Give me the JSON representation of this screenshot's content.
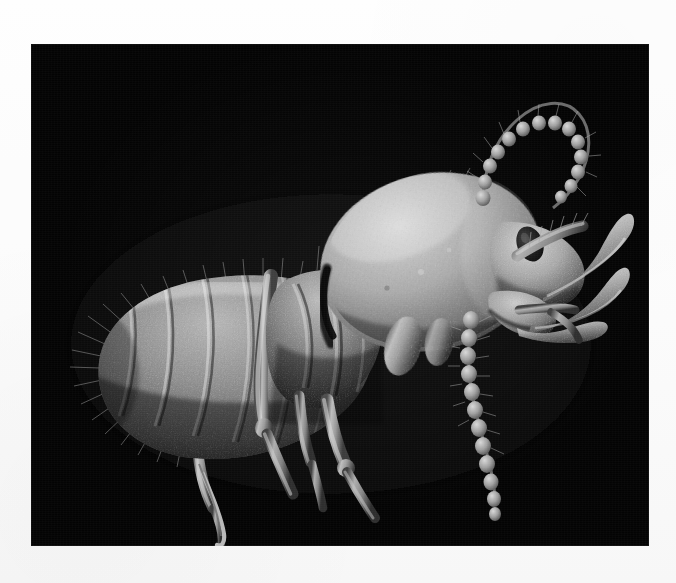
{
  "page": {
    "background_color": "#fcfcfc",
    "width": 676,
    "height": 583
  },
  "plate": {
    "name": "sem-micrograph",
    "background_color": "#030303",
    "x": 31,
    "y": 44,
    "width": 618,
    "height": 502,
    "caption": "",
    "scale_bar_label": "",
    "magnification_label": ""
  },
  "specimen": {
    "common_name": "booklouse",
    "description": "Scanning electron micrograph of a wingless psocid-like insect in left lateral view on a black field",
    "orientation": "left lateral, head to the upper right",
    "palette": {
      "background": "#030303",
      "cuticle_dark": "#3a3a3a",
      "cuticle_mid": "#8a8a8a",
      "cuticle_light": "#c9c9c9",
      "highlight": "#e6e6e6",
      "shadow": "#141414",
      "eye": "#1a1a1a"
    },
    "parts": [
      {
        "id": "abdomen",
        "label": "segmented abdomen",
        "segments": 8
      },
      {
        "id": "thorax",
        "label": "thorax"
      },
      {
        "id": "head",
        "label": "head capsule"
      },
      {
        "id": "eye",
        "label": "compound eye"
      },
      {
        "id": "antenna-upper",
        "label": "upper moniliform antenna",
        "beads": 13
      },
      {
        "id": "antenna-lower",
        "label": "lower moniliform antenna",
        "beads": 12
      },
      {
        "id": "mandible-upper",
        "label": "upper curved mandible"
      },
      {
        "id": "mandible-lower",
        "label": "lower curved mandible"
      },
      {
        "id": "maxillary-palp",
        "label": "maxillary palp"
      },
      {
        "id": "foreleg",
        "label": "foreleg"
      },
      {
        "id": "midleg",
        "label": "midleg"
      },
      {
        "id": "hindleg",
        "label": "hindleg"
      },
      {
        "id": "hindleg-long",
        "label": "long hind leg with tarsal claw"
      },
      {
        "id": "tarsal-claw",
        "label": "tarsal claw"
      },
      {
        "id": "setae",
        "label": "cuticular setae (hairs)"
      }
    ]
  }
}
